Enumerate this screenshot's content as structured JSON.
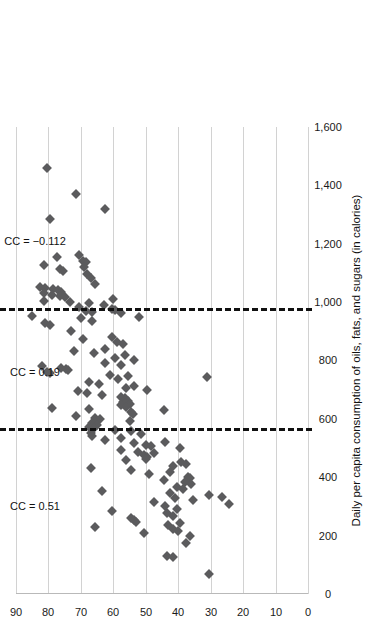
{
  "chart_data": {
    "type": "scatter",
    "title": "",
    "orientation": "rotated-90",
    "xlabel": "Daily per capita consumption of oils, fats, and sugars (in calories)",
    "ylabel_line1": "Life",
    "ylabel_line2": "satisfaction",
    "xlim": [
      0,
      1600
    ],
    "ylim": [
      0,
      90
    ],
    "xticks": [
      "0",
      "200",
      "400",
      "600",
      "800",
      "1,000",
      "1,200",
      "1,400",
      "1,600"
    ],
    "xtick_values": [
      0,
      200,
      400,
      600,
      800,
      1000,
      1200,
      1400,
      1600
    ],
    "yticks": [
      "0",
      "10",
      "20",
      "30",
      "40",
      "50",
      "60",
      "70",
      "80",
      "90"
    ],
    "ytick_values": [
      0,
      10,
      20,
      30,
      40,
      50,
      60,
      70,
      80,
      90
    ],
    "grid": "y-gridlines-only",
    "legend": "none",
    "marker_color": "#5b5b5d",
    "marker_shape": "diamond",
    "gridline_color": "#d2d2d2",
    "axis_color": "#b9b9b9",
    "dividers": [
      {
        "value": 560,
        "style": "dashed",
        "color": "#111111"
      },
      {
        "value": 970,
        "style": "dashed",
        "color": "#111111"
      }
    ],
    "annotations": [
      {
        "text": "CC = 0.51",
        "segment": "0-560",
        "x": 300,
        "y": 84
      },
      {
        "text": "CC = 0.19",
        "segment": "560-970",
        "x": 760,
        "y": 84
      },
      {
        "text": "CC = −0.112",
        "segment": "970-1600",
        "x": 1210,
        "y": 84
      }
    ],
    "points": [
      {
        "x": 1460,
        "y": 80.5
      },
      {
        "x": 1370,
        "y": 71.5
      },
      {
        "x": 1318,
        "y": 62.5
      },
      {
        "x": 1285,
        "y": 79.5
      },
      {
        "x": 1162,
        "y": 70.5
      },
      {
        "x": 1155,
        "y": 77.5
      },
      {
        "x": 1140,
        "y": 69.5
      },
      {
        "x": 1138,
        "y": 68.5
      },
      {
        "x": 1128,
        "y": 81.5
      },
      {
        "x": 1120,
        "y": 69.0
      },
      {
        "x": 1112,
        "y": 76.5
      },
      {
        "x": 1106,
        "y": 75.5
      },
      {
        "x": 1098,
        "y": 68.0
      },
      {
        "x": 1082,
        "y": 67.0
      },
      {
        "x": 1062,
        "y": 65.5
      },
      {
        "x": 1052,
        "y": 82.5
      },
      {
        "x": 1048,
        "y": 81.0
      },
      {
        "x": 1046,
        "y": 78.5
      },
      {
        "x": 1040,
        "y": 77.0
      },
      {
        "x": 1036,
        "y": 76.0
      },
      {
        "x": 1030,
        "y": 81.5
      },
      {
        "x": 1026,
        "y": 79.0
      },
      {
        "x": 1022,
        "y": 76.5
      },
      {
        "x": 1016,
        "y": 75.0
      },
      {
        "x": 1010,
        "y": 60.0
      },
      {
        "x": 1004,
        "y": 81.5
      },
      {
        "x": 1000,
        "y": 73.5
      },
      {
        "x": 996,
        "y": 67.5
      },
      {
        "x": 990,
        "y": 63.0
      },
      {
        "x": 982,
        "y": 70.5
      },
      {
        "x": 978,
        "y": 60.5
      },
      {
        "x": 974,
        "y": 59.5
      },
      {
        "x": 970,
        "y": 68.5
      },
      {
        "x": 966,
        "y": 66.5
      },
      {
        "x": 962,
        "y": 57.5
      },
      {
        "x": 952,
        "y": 85.0
      },
      {
        "x": 948,
        "y": 52.0
      },
      {
        "x": 944,
        "y": 70.0
      },
      {
        "x": 936,
        "y": 66.5
      },
      {
        "x": 928,
        "y": 81.0
      },
      {
        "x": 920,
        "y": 79.5
      },
      {
        "x": 900,
        "y": 73.0
      },
      {
        "x": 880,
        "y": 60.5
      },
      {
        "x": 872,
        "y": 69.5
      },
      {
        "x": 862,
        "y": 59.0
      },
      {
        "x": 855,
        "y": 57.0
      },
      {
        "x": 840,
        "y": 62.5
      },
      {
        "x": 832,
        "y": 72.0
      },
      {
        "x": 824,
        "y": 66.0
      },
      {
        "x": 818,
        "y": 56.5
      },
      {
        "x": 810,
        "y": 59.5
      },
      {
        "x": 800,
        "y": 53.5
      },
      {
        "x": 792,
        "y": 62.5
      },
      {
        "x": 786,
        "y": 57.5
      },
      {
        "x": 780,
        "y": 82.0
      },
      {
        "x": 774,
        "y": 76.0
      },
      {
        "x": 770,
        "y": 74.5
      },
      {
        "x": 766,
        "y": 74.0
      },
      {
        "x": 762,
        "y": 80.5
      },
      {
        "x": 756,
        "y": 79.5
      },
      {
        "x": 752,
        "y": 61.0
      },
      {
        "x": 748,
        "y": 55.5
      },
      {
        "x": 742,
        "y": 31.0
      },
      {
        "x": 736,
        "y": 58.5
      },
      {
        "x": 728,
        "y": 67.5
      },
      {
        "x": 720,
        "y": 64.5
      },
      {
        "x": 712,
        "y": 53.5
      },
      {
        "x": 706,
        "y": 56.0
      },
      {
        "x": 700,
        "y": 49.5
      },
      {
        "x": 694,
        "y": 71.0
      },
      {
        "x": 688,
        "y": 68.0
      },
      {
        "x": 682,
        "y": 63.5
      },
      {
        "x": 676,
        "y": 57.5
      },
      {
        "x": 670,
        "y": 56.5
      },
      {
        "x": 666,
        "y": 56.0
      },
      {
        "x": 662,
        "y": 55.5
      },
      {
        "x": 658,
        "y": 57.0
      },
      {
        "x": 654,
        "y": 56.5
      },
      {
        "x": 650,
        "y": 55.0
      },
      {
        "x": 646,
        "y": 57.5
      },
      {
        "x": 642,
        "y": 56.0
      },
      {
        "x": 638,
        "y": 79.0
      },
      {
        "x": 634,
        "y": 67.5
      },
      {
        "x": 630,
        "y": 44.5
      },
      {
        "x": 624,
        "y": 54.5
      },
      {
        "x": 618,
        "y": 54.0
      },
      {
        "x": 610,
        "y": 71.5
      },
      {
        "x": 604,
        "y": 65.5
      },
      {
        "x": 598,
        "y": 64.0
      },
      {
        "x": 592,
        "y": 55.0
      },
      {
        "x": 586,
        "y": 66.5
      },
      {
        "x": 578,
        "y": 65.0
      },
      {
        "x": 572,
        "y": 67.5
      },
      {
        "x": 568,
        "y": 66.0
      },
      {
        "x": 562,
        "y": 59.5
      },
      {
        "x": 558,
        "y": 54.5
      },
      {
        "x": 552,
        "y": 67.0
      },
      {
        "x": 548,
        "y": 51.5
      },
      {
        "x": 540,
        "y": 66.5
      },
      {
        "x": 534,
        "y": 57.5
      },
      {
        "x": 528,
        "y": 62.5
      },
      {
        "x": 522,
        "y": 44.0
      },
      {
        "x": 516,
        "y": 53.5
      },
      {
        "x": 510,
        "y": 50.0
      },
      {
        "x": 506,
        "y": 48.5
      },
      {
        "x": 500,
        "y": 39.5
      },
      {
        "x": 494,
        "y": 57.5
      },
      {
        "x": 488,
        "y": 52.5
      },
      {
        "x": 482,
        "y": 47.5
      },
      {
        "x": 476,
        "y": 50.5
      },
      {
        "x": 470,
        "y": 49.5
      },
      {
        "x": 464,
        "y": 50.0
      },
      {
        "x": 458,
        "y": 56.0
      },
      {
        "x": 452,
        "y": 39.0
      },
      {
        "x": 446,
        "y": 37.5
      },
      {
        "x": 440,
        "y": 41.5
      },
      {
        "x": 432,
        "y": 67.0
      },
      {
        "x": 426,
        "y": 54.5
      },
      {
        "x": 418,
        "y": 42.5
      },
      {
        "x": 410,
        "y": 49.0
      },
      {
        "x": 402,
        "y": 37.0
      },
      {
        "x": 396,
        "y": 36.5
      },
      {
        "x": 390,
        "y": 44.5
      },
      {
        "x": 384,
        "y": 38.0
      },
      {
        "x": 376,
        "y": 36.0
      },
      {
        "x": 368,
        "y": 40.5
      },
      {
        "x": 360,
        "y": 38.5
      },
      {
        "x": 352,
        "y": 63.5
      },
      {
        "x": 346,
        "y": 42.5
      },
      {
        "x": 340,
        "y": 30.5
      },
      {
        "x": 334,
        "y": 26.5
      },
      {
        "x": 328,
        "y": 41.0
      },
      {
        "x": 322,
        "y": 35.5
      },
      {
        "x": 316,
        "y": 47.5
      },
      {
        "x": 310,
        "y": 24.5
      },
      {
        "x": 300,
        "y": 44.0
      },
      {
        "x": 292,
        "y": 40.5
      },
      {
        "x": 284,
        "y": 60.5
      },
      {
        "x": 276,
        "y": 43.5
      },
      {
        "x": 268,
        "y": 41.5
      },
      {
        "x": 262,
        "y": 54.5
      },
      {
        "x": 254,
        "y": 53.5
      },
      {
        "x": 248,
        "y": 53.0
      },
      {
        "x": 242,
        "y": 39.5
      },
      {
        "x": 236,
        "y": 43.0
      },
      {
        "x": 230,
        "y": 65.5
      },
      {
        "x": 224,
        "y": 41.5
      },
      {
        "x": 216,
        "y": 40.0
      },
      {
        "x": 208,
        "y": 50.5
      },
      {
        "x": 200,
        "y": 36.5
      },
      {
        "x": 176,
        "y": 37.5
      },
      {
        "x": 130,
        "y": 43.5
      },
      {
        "x": 126,
        "y": 41.5
      },
      {
        "x": 70,
        "y": 30.5
      }
    ]
  }
}
